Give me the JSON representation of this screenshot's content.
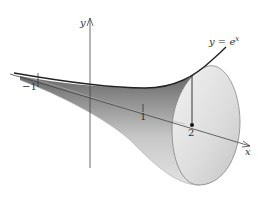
{
  "figure": {
    "type": "solid-of-revolution",
    "curve_label": "y = e",
    "curve_label_exp": "x",
    "axis_y_label": "y",
    "axis_x_label": "x",
    "tick_minus_one": "−1",
    "tick_one": "1",
    "tick_two": "2"
  }
}
